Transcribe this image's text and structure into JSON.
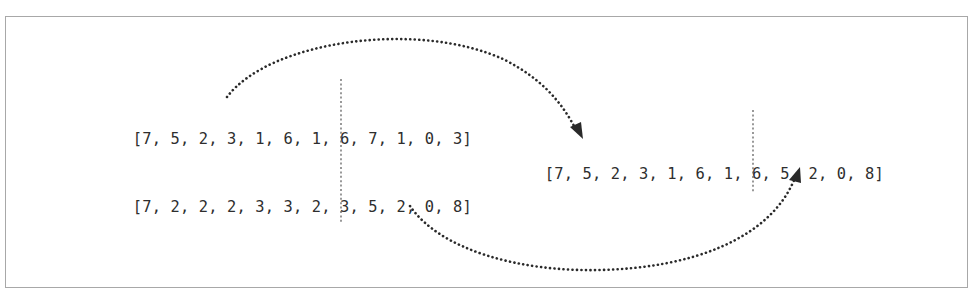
{
  "diagram": {
    "type": "crossover-illustration",
    "parent_a": {
      "left": "[7, 5, 2, 3, 1, 6, 1, 6,",
      "right": " 7, 1, 0, 3]",
      "values": [
        7,
        5,
        2,
        3,
        1,
        6,
        1,
        6,
        7,
        1,
        0,
        3
      ]
    },
    "parent_b": {
      "left": "[7, 2, 2, 2, 3, 3, 2, 3,",
      "right": " 5, 2, 0, 8]",
      "values": [
        7,
        2,
        2,
        2,
        3,
        3,
        2,
        3,
        5,
        2,
        0,
        8
      ]
    },
    "child": {
      "left": "[7, 5, 2, 3, 1, 6, 1, 6,",
      "right": " 5, 2, 0, 8]",
      "values": [
        7,
        5,
        2,
        3,
        1,
        6,
        1,
        6,
        5,
        2,
        0,
        8
      ]
    },
    "split_index": 8,
    "arrows": [
      {
        "from": "parent_a.left",
        "to": "child.left",
        "style": "dotted-arc-over"
      },
      {
        "from": "parent_b.right",
        "to": "child.right",
        "style": "dotted-arc-under"
      }
    ],
    "colors": {
      "text": "#2e2e2e",
      "arrow": "#2a2a2a",
      "border": "#a8a8a8",
      "divider": "#555555"
    }
  }
}
